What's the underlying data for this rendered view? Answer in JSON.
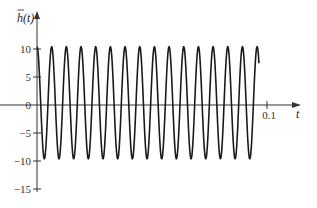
{
  "chart_data": {
    "type": "line",
    "title": "",
    "xlabel": "t",
    "ylabel": "h̄(t)",
    "ylabel_base": "h",
    "ylabel_arg": "(t)",
    "xlim": [
      0,
      0.12
    ],
    "ylim": [
      -16,
      17
    ],
    "x_ticks": [
      {
        "value": 0.1,
        "label": "0.1"
      }
    ],
    "y_ticks": [
      {
        "value": 10,
        "label": "10"
      },
      {
        "value": 5,
        "label": "5"
      },
      {
        "value": 0,
        "label": "0"
      },
      {
        "value": -5,
        "label": "−5"
      },
      {
        "value": -10,
        "label": "−10"
      },
      {
        "value": -15,
        "label": "−15"
      }
    ],
    "grid": false,
    "legend": null,
    "series": [
      {
        "name": "h̄(t)",
        "form": "cosine",
        "amplitude": 10,
        "offset": 0.4,
        "cycles": 15,
        "period": 0.00638,
        "t_start": 0,
        "t_end": 0.0965,
        "peak_value": 10.4,
        "trough_value": -9.6,
        "color": "#1a1a1a"
      }
    ]
  },
  "layout": {
    "origin_x": 37,
    "origin_y": 105,
    "px_per_x": 2300,
    "px_per_y": 5.6,
    "x_axis_end": 301,
    "y_axis_top": 11,
    "y_axis_bottom": 192
  }
}
